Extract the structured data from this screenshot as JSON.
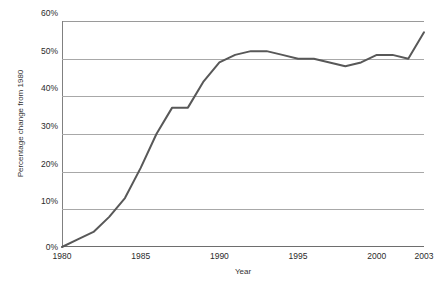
{
  "chart_data": {
    "type": "line",
    "title": "",
    "xlabel": "Year",
    "ylabel": "Percentage change from 1980",
    "xlim": [
      1980,
      2003
    ],
    "ylim": [
      0,
      60
    ],
    "grid": true,
    "legend": false,
    "legend_position": "none",
    "line_color": "#585858",
    "y_ticks": [
      {
        "value": 60,
        "label": "60%"
      },
      {
        "value": 50,
        "label": "50%"
      },
      {
        "value": 40,
        "label": "40%"
      },
      {
        "value": 30,
        "label": "30%"
      },
      {
        "value": 20,
        "label": "20%"
      },
      {
        "value": 10,
        "label": "10%"
      },
      {
        "value": 0,
        "label": "0%"
      }
    ],
    "x_ticks": [
      {
        "value": 1980,
        "label": "1980"
      },
      {
        "value": 1985,
        "label": "1985"
      },
      {
        "value": 1990,
        "label": "1990"
      },
      {
        "value": 1995,
        "label": "1995"
      },
      {
        "value": 2000,
        "label": "2000"
      },
      {
        "value": 2003,
        "label": "2003"
      }
    ],
    "series": [
      {
        "name": "Percentage change from 1980",
        "x": [
          1980,
          1981,
          1982,
          1983,
          1984,
          1985,
          1986,
          1987,
          1988,
          1989,
          1990,
          1991,
          1992,
          1993,
          1994,
          1995,
          1996,
          1997,
          1998,
          1999,
          2000,
          2001,
          2002,
          2003
        ],
        "values": [
          0,
          2,
          4,
          8,
          13,
          21,
          30,
          37,
          37,
          44,
          49,
          51,
          52,
          52,
          51,
          50,
          50,
          49,
          48,
          49,
          51,
          51,
          50,
          57
        ]
      }
    ]
  }
}
